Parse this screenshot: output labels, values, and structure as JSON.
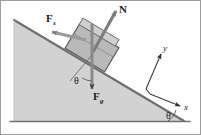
{
  "figure": {
    "kind": "free-body-diagram",
    "canvas": {
      "width": 201,
      "height": 135
    },
    "colors": {
      "background": "#ffffff",
      "incline_fill": "#d0d0d0",
      "incline_edge": "#6b6b6b",
      "block_fill": "#b8b8b8",
      "block_edge": "#5a5a5a",
      "arrow": "#808080",
      "arrow_dark": "#4d4d4d",
      "axis": "#7a7a7a",
      "text": "#1a1a1a",
      "border": "#9a9a9a"
    }
  },
  "vectors": {
    "normal": {
      "symbol": "N",
      "subscript": "",
      "description": "normal force, perpendicular to incline surface, pointing up and to the right"
    },
    "applied": {
      "symbol": "F",
      "subscript": "s",
      "description": "force directed up the slope, to the upper left"
    },
    "gravity": {
      "symbol": "F",
      "subscript": "g",
      "description": "gravitational force, pointing straight down"
    }
  },
  "angles": {
    "block_theta": {
      "symbol": "θ",
      "description": "angle between the downward gravity vector and the incline normal direction"
    },
    "incline_theta": {
      "symbol": "θ",
      "description": "incline angle measured between the slope and the horizontal base"
    }
  },
  "axes": {
    "y": {
      "label": "y",
      "description": "y axis, parallel to the normal force, up and to the right"
    },
    "x": {
      "label": "x",
      "description": "x axis, parallel to the incline surface, down and to the right"
    }
  }
}
